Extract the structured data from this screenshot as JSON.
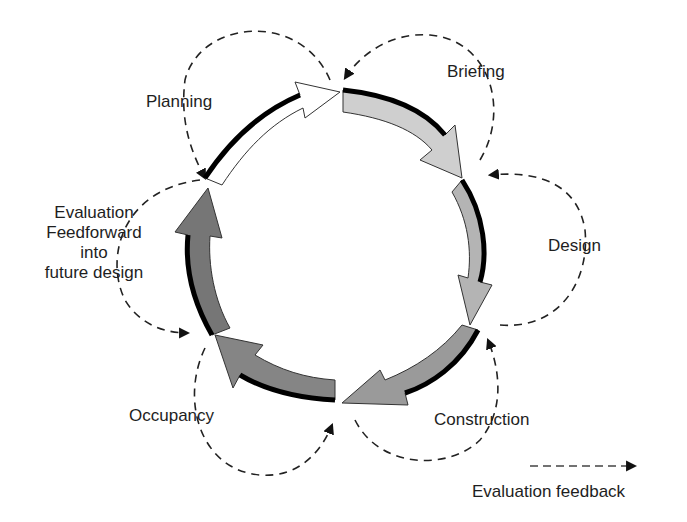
{
  "diagram": {
    "stages": [
      {
        "id": "planning",
        "label": "Planning",
        "fill": "#ffffff"
      },
      {
        "id": "briefing",
        "label": "Briefing",
        "fill": "#cfcfcf"
      },
      {
        "id": "design",
        "label": "Design",
        "fill": "#b4b4b4"
      },
      {
        "id": "construction",
        "label": "Construction",
        "fill": "#9a9a9a"
      },
      {
        "id": "occupancy",
        "label": "Occupancy",
        "fill": "#858585"
      },
      {
        "id": "evaluation",
        "label_lines": [
          "Evaluation",
          "Feedforward",
          "into",
          "future design"
        ],
        "fill": "#767676"
      }
    ],
    "legend": {
      "label": "Evaluation feedback"
    },
    "colors": {
      "outline": "#000000",
      "dash": "#222222"
    }
  }
}
